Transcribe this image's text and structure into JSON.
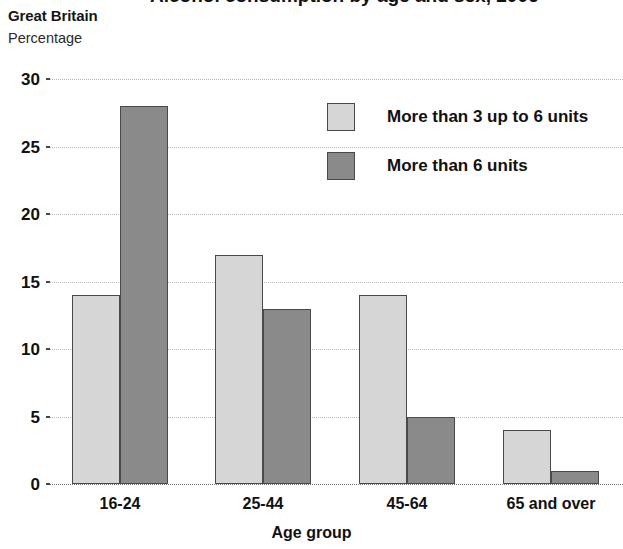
{
  "header": {
    "title_cutoff": "Alcohol consumption by age and sex, 2006",
    "region": "Great Britain",
    "unit": "Percentage"
  },
  "legend": {
    "items": [
      {
        "label": "More than 3 up to 6 units",
        "color": "#d6d6d6",
        "name": "legend-light"
      },
      {
        "label": "More than 6 units",
        "color": "#8a8a8a",
        "name": "legend-dark"
      }
    ]
  },
  "chart_data": {
    "type": "bar",
    "title": "Alcohol consumption by age and sex, 2006",
    "subtitle": "Great Britain",
    "xlabel": "Age group",
    "ylabel": "Percentage",
    "categories": [
      "16-24",
      "25-44",
      "45-64",
      "65 and over"
    ],
    "series": [
      {
        "name": "More than 3 up to 6 units",
        "color": "#d6d6d6",
        "values": [
          14,
          17,
          14,
          4
        ]
      },
      {
        "name": "More than 6 units",
        "color": "#8a8a8a",
        "values": [
          28,
          13,
          5,
          1
        ]
      }
    ],
    "ylim": [
      0,
      30
    ],
    "ytick_step": 5,
    "yticks": [
      30,
      25,
      20,
      15,
      10,
      5,
      0
    ],
    "grid": true,
    "legend_position": "upper right"
  }
}
